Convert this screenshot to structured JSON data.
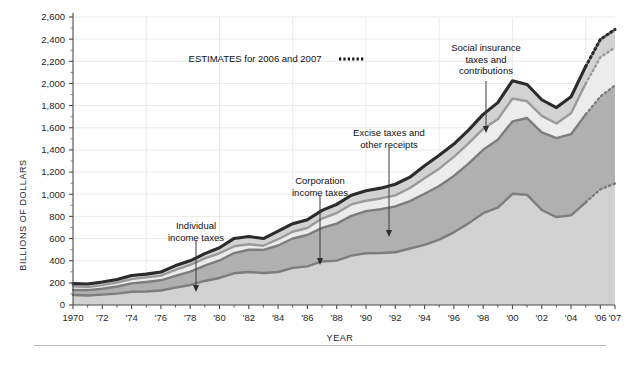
{
  "chart_data": {
    "type": "area",
    "title": "",
    "xlabel": "YEAR",
    "ylabel": "BILLIONS OF DOLLARS",
    "ylim": [
      0,
      2600
    ],
    "xlim": [
      1970,
      2007
    ],
    "grid": true,
    "legend_position": "annotations",
    "y_ticks": [
      "0",
      "200",
      "400",
      "600",
      "800",
      "1,000",
      "1,200",
      "1,400",
      "1,600",
      "1,800",
      "2,000",
      "2,200",
      "2,400",
      "2,600"
    ],
    "y_tick_values": [
      0,
      200,
      400,
      600,
      800,
      1000,
      1200,
      1400,
      1600,
      1800,
      2000,
      2200,
      2400,
      2600
    ],
    "x_ticks": [
      "1970",
      "'72",
      "'74",
      "'76",
      "'78",
      "'80",
      "'82",
      "'84",
      "'86",
      "'88",
      "'90",
      "'92",
      "'94",
      "'96",
      "'98",
      "'00",
      "'02",
      "'04",
      "'06",
      "'07"
    ],
    "x_tick_values": [
      1970,
      1972,
      1974,
      1976,
      1978,
      1980,
      1982,
      1984,
      1986,
      1988,
      1990,
      1992,
      1994,
      1996,
      1998,
      2000,
      2002,
      2004,
      2006,
      2007
    ],
    "x": [
      1970,
      1971,
      1972,
      1973,
      1974,
      1975,
      1976,
      1977,
      1978,
      1979,
      1980,
      1981,
      1982,
      1983,
      1984,
      1985,
      1986,
      1987,
      1988,
      1989,
      1990,
      1991,
      1992,
      1993,
      1994,
      1995,
      1996,
      1997,
      1998,
      1999,
      2000,
      2001,
      2002,
      2003,
      2004,
      2005,
      2006,
      2007
    ],
    "estimate_years": [
      2006,
      2007
    ],
    "series": [
      {
        "name": "Individual income taxes",
        "fill": "#d2d2d2",
        "line": "#7d7d7d",
        "values": [
          90,
          86,
          94,
          103,
          119,
          122,
          131,
          157,
          181,
          217,
          244,
          286,
          298,
          289,
          298,
          335,
          349,
          393,
          401,
          446,
          467,
          468,
          476,
          510,
          543,
          590,
          656,
          737,
          829,
          879,
          1004,
          994,
          858,
          794,
          809,
          927,
          1044,
          1097
        ]
      },
      {
        "name": "Social insurance taxes and contributions",
        "fill": "#b0b0b0",
        "line": "#7d7d7d",
        "values": [
          45,
          48,
          53,
          64,
          76,
          86,
          92,
          106,
          121,
          138,
          158,
          183,
          201,
          209,
          239,
          265,
          283,
          303,
          334,
          359,
          380,
          396,
          414,
          428,
          461,
          484,
          509,
          540,
          572,
          612,
          653,
          694,
          701,
          713,
          733,
          794,
          838,
          885
        ]
      },
      {
        "name": "Corporation income taxes",
        "fill": "#ececec",
        "line": "#9a9a9a",
        "values": [
          33,
          27,
          32,
          36,
          39,
          41,
          42,
          55,
          60,
          66,
          65,
          61,
          49,
          37,
          57,
          61,
          63,
          84,
          95,
          103,
          94,
          98,
          100,
          118,
          140,
          157,
          172,
          182,
          189,
          185,
          207,
          151,
          148,
          132,
          189,
          278,
          354,
          342
        ]
      },
      {
        "name": "Excise taxes and other receipts",
        "fill": "#d2d2d2",
        "line": "#2b2b2b",
        "values": [
          25,
          28,
          28,
          28,
          32,
          30,
          33,
          38,
          37,
          43,
          50,
          71,
          70,
          65,
          72,
          73,
          74,
          74,
          79,
          83,
          91,
          93,
          100,
          98,
          113,
          121,
          116,
          120,
          131,
          151,
          161,
          152,
          146,
          143,
          149,
          155,
          161,
          164
        ]
      }
    ],
    "annotations": [
      {
        "id": "estimates-note",
        "lines": [
          "ESTIMATES for 2006 and 2007"
        ],
        "marker": "dotted-swatch"
      },
      {
        "id": "individual-income-taxes",
        "lines": [
          "Individual",
          "income taxes"
        ],
        "arrow": "down"
      },
      {
        "id": "corporation-income-taxes",
        "lines": [
          "Corporation",
          "income taxes"
        ],
        "arrow": "down"
      },
      {
        "id": "excise-taxes-other-receipts",
        "lines": [
          "Excise taxes and",
          "other receipts"
        ],
        "arrow": "down"
      },
      {
        "id": "social-insurance",
        "lines": [
          "Social insurance",
          "taxes and",
          "contributions"
        ],
        "arrow": "down"
      }
    ]
  }
}
